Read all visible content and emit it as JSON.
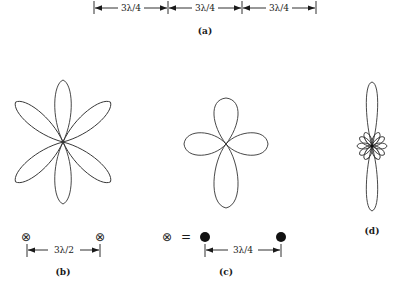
{
  "figure": {
    "panel_a": {
      "caption": "(a)",
      "segments": [
        "3λ/4",
        "3λ/4",
        "3λ/4"
      ]
    },
    "panel_b": {
      "caption": "(b)",
      "lobe_count": 6,
      "element_symbol": "⊗",
      "spacing": "3λ/2"
    },
    "panel_c": {
      "caption": "(c)",
      "lobe_count": 4,
      "element_symbol": "⊗",
      "equals": "=",
      "spacing": "3λ/4"
    },
    "panel_d": {
      "caption": "(d)",
      "description": "narrow main lobe with small side lobes"
    }
  }
}
